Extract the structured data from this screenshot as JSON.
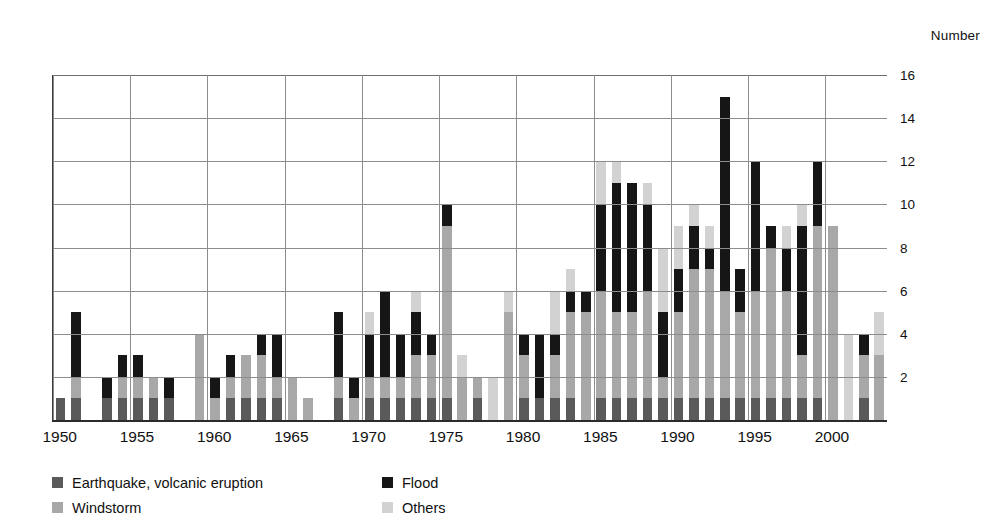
{
  "axis": {
    "unit_caption": "Number",
    "y_ticks": [
      2,
      4,
      6,
      8,
      10,
      12,
      14,
      16
    ],
    "x_ticks": [
      "1950",
      "1955",
      "1960",
      "1965",
      "1970",
      "1975",
      "1980",
      "1985",
      "1990",
      "1995",
      "2000"
    ]
  },
  "legend": {
    "items": [
      {
        "key": "earthquake",
        "label": "Earthquake, volcanic eruption",
        "color": "#5a5a5a"
      },
      {
        "key": "flood",
        "label": "Flood",
        "color": "#161616"
      },
      {
        "key": "windstorm",
        "label": "Windstorm",
        "color": "#a8a8a8"
      },
      {
        "key": "others",
        "label": "Others",
        "color": "#d2d2d2"
      }
    ]
  },
  "chart_data": {
    "type": "bar",
    "stacked": true,
    "title": "",
    "subtitle": "",
    "xlabel": "",
    "ylabel": "Number",
    "ylim": [
      0,
      16
    ],
    "ytick_step": 2,
    "grid": true,
    "legend_position": "bottom-left",
    "series_order": [
      "earthquake",
      "windstorm",
      "flood",
      "others"
    ],
    "series": [
      {
        "name": "Earthquake, volcanic eruption",
        "key": "earthquake",
        "color": "#5a5a5a",
        "values": [
          1,
          1,
          0,
          1,
          1,
          1,
          1,
          1,
          0,
          0,
          0,
          1,
          1,
          1,
          1,
          0,
          0,
          0,
          1,
          0,
          1,
          1,
          1,
          1,
          1,
          1,
          0,
          1,
          0,
          0,
          1,
          1,
          1,
          1,
          0,
          1,
          1,
          1,
          1,
          1,
          1,
          1,
          1,
          1,
          1,
          1,
          1,
          1,
          1,
          1,
          0,
          0,
          1,
          0
        ]
      },
      {
        "name": "Windstorm",
        "key": "windstorm",
        "color": "#a8a8a8",
        "values": [
          0,
          1,
          0,
          0,
          1,
          1,
          1,
          0,
          0,
          4,
          1,
          1,
          2,
          2,
          1,
          2,
          1,
          0,
          1,
          1,
          1,
          1,
          1,
          2,
          2,
          8,
          2,
          1,
          0,
          5,
          2,
          0,
          2,
          4,
          5,
          5,
          4,
          4,
          5,
          1,
          4,
          6,
          6,
          5,
          4,
          5,
          7,
          5,
          2,
          8,
          9,
          0,
          2,
          3
        ]
      },
      {
        "name": "Flood",
        "key": "flood",
        "color": "#161616",
        "values": [
          0,
          3,
          0,
          1,
          1,
          1,
          0,
          1,
          0,
          0,
          1,
          1,
          0,
          1,
          2,
          0,
          0,
          0,
          3,
          1,
          2,
          4,
          2,
          2,
          1,
          1,
          0,
          0,
          0,
          0,
          1,
          3,
          1,
          1,
          1,
          4,
          6,
          6,
          4,
          3,
          2,
          2,
          1,
          9,
          2,
          6,
          1,
          2,
          6,
          3,
          0,
          0,
          1,
          0
        ]
      },
      {
        "name": "Others",
        "key": "others",
        "color": "#d2d2d2",
        "values": [
          0,
          0,
          0,
          0,
          0,
          0,
          0,
          0,
          0,
          0,
          0,
          0,
          0,
          0,
          0,
          0,
          0,
          0,
          0,
          0,
          1,
          0,
          0,
          1,
          0,
          0,
          1,
          0,
          2,
          1,
          0,
          0,
          2,
          1,
          0,
          2,
          1,
          0,
          1,
          3,
          2,
          1,
          1,
          0,
          0,
          0,
          0,
          1,
          1,
          0,
          0,
          4,
          0,
          2
        ]
      }
    ],
    "categories": [
      1950,
      1951,
      1952,
      1953,
      1954,
      1955,
      1956,
      1957,
      1958,
      1959,
      1960,
      1961,
      1962,
      1963,
      1964,
      1965,
      1966,
      1967,
      1968,
      1969,
      1970,
      1971,
      1972,
      1973,
      1974,
      1975,
      1976,
      1977,
      1978,
      1979,
      1980,
      1981,
      1982,
      1983,
      1984,
      1985,
      1986,
      1987,
      1988,
      1989,
      1990,
      1991,
      1992,
      1993,
      1994,
      1995,
      1996,
      1997,
      1998,
      1999,
      2000,
      2001,
      2002,
      2003
    ],
    "totals": [
      1,
      5,
      0,
      2,
      3,
      3,
      2,
      2,
      0,
      4,
      2,
      3,
      3,
      4,
      4,
      2,
      2,
      1,
      4,
      2,
      5,
      6,
      4,
      5,
      4,
      10,
      3,
      2,
      2,
      6,
      4,
      4,
      6,
      6,
      6,
      12,
      12,
      11,
      10,
      8,
      9,
      10,
      9,
      15,
      6,
      12,
      9,
      7,
      9,
      12,
      10,
      4,
      4,
      5
    ]
  }
}
